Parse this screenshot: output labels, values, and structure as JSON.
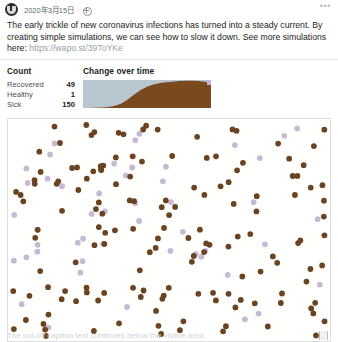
{
  "post": {
    "avatar_icon": "washington-post-logo-icon",
    "date": "2020年3月15日",
    "separator": "·",
    "audience_icon": "globe-icon",
    "more_icon": "more-options-icon",
    "more_label": "•••",
    "body_line1": "The early trickle of new coronavirus infections has turned into a steady current. By creating",
    "body_line2": "simple simulations, we can see how to slow it down. See more simulations here:",
    "link": "https://wapo.st/39ToYKe"
  },
  "count_panel": {
    "title": "Count",
    "rows": [
      {
        "label": "Recovered",
        "value": "49"
      },
      {
        "label": "Healthy",
        "value": "1"
      },
      {
        "label": "Sick",
        "value": "150"
      }
    ]
  },
  "chart_panel": {
    "title": "Change over time"
  },
  "simulation": {
    "name": "simulation-dot-field",
    "sick_color": "#6b4321",
    "recovered_color": "#c6b9d6",
    "background": "#fffffd",
    "border_color": "#dcdee1",
    "resize_handle_icon": "resize-handle-icon"
  },
  "footer": {
    "ghost_text": "The cut-off caption text continues below the visible area"
  },
  "chart_data": {
    "type": "area",
    "title": "Change over time",
    "xlabel": "",
    "ylabel": "",
    "series": [
      {
        "name": "Sick",
        "color": "#7a4a1e",
        "x": [
          0,
          5,
          10,
          15,
          20,
          25,
          30,
          35,
          40,
          45,
          50,
          55,
          60,
          65,
          70,
          75,
          80,
          85,
          90,
          95,
          100
        ],
        "values": [
          0,
          0,
          1,
          2,
          4,
          8,
          16,
          30,
          48,
          64,
          76,
          84,
          89,
          92,
          94,
          96,
          97,
          97,
          96,
          94,
          92
        ]
      },
      {
        "name": "Healthy",
        "color": "#b7c6cf",
        "x": [
          0,
          5,
          10,
          15,
          20,
          25,
          30,
          35,
          40,
          45,
          50,
          55,
          60,
          65,
          70,
          75,
          80,
          85,
          90,
          95,
          100
        ],
        "values": [
          100,
          100,
          99,
          98,
          96,
          92,
          84,
          70,
          52,
          36,
          24,
          16,
          11,
          8,
          6,
          4,
          3,
          3,
          3,
          3,
          3
        ]
      },
      {
        "name": "Recovered",
        "color": "#c3b3d6",
        "x": [
          0,
          5,
          10,
          15,
          20,
          25,
          30,
          35,
          40,
          45,
          50,
          55,
          60,
          65,
          70,
          75,
          80,
          85,
          90,
          95,
          100
        ],
        "values": [
          0,
          0,
          0,
          0,
          0,
          0,
          0,
          0,
          0,
          0,
          0,
          0,
          0,
          0,
          0,
          0,
          0,
          0,
          1,
          3,
          5
        ]
      }
    ],
    "ylim": [
      0,
      100
    ],
    "grid": false,
    "legend": "none"
  }
}
